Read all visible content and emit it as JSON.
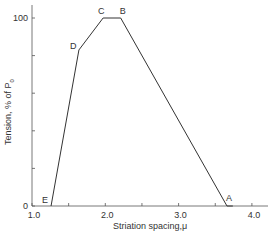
{
  "chart_data": {
    "type": "line",
    "title": "",
    "xlabel": "Striation spacing,μ",
    "ylabel": "Tension, % of P",
    "ylabel_subscript": "0",
    "xlim": [
      1.0,
      4.2
    ],
    "ylim": [
      0,
      100
    ],
    "x_ticks": [
      1.0,
      1.5,
      2.0,
      2.5,
      3.0,
      3.5,
      4.0
    ],
    "x_tick_labels": [
      "1.0",
      "",
      "2.0",
      "",
      "3.0",
      "",
      "4.0"
    ],
    "y_ticks": [
      0,
      20,
      40,
      60,
      80,
      100
    ],
    "y_tick_labels": [
      "0",
      "",
      "",
      "",
      "",
      "100"
    ],
    "grid": false,
    "series": [
      {
        "name": "Length-tension curve",
        "x": [
          1.26,
          1.64,
          1.97,
          2.21,
          3.66,
          3.74
        ],
        "y": [
          0,
          83,
          100,
          100,
          0,
          0
        ],
        "point_labels": [
          "E",
          "D",
          "C",
          "B",
          "A",
          ""
        ]
      }
    ],
    "annotations": [
      {
        "text": "E",
        "x": 1.26,
        "y": 0
      },
      {
        "text": "D",
        "x": 1.64,
        "y": 83
      },
      {
        "text": "C",
        "x": 1.97,
        "y": 100
      },
      {
        "text": "B",
        "x": 2.21,
        "y": 100
      },
      {
        "text": "A",
        "x": 3.66,
        "y": 0
      }
    ]
  }
}
